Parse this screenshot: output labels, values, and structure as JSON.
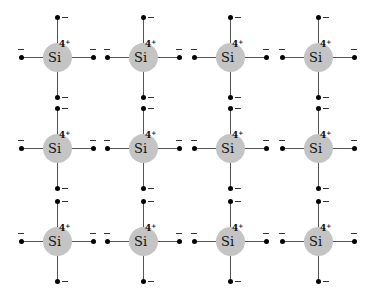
{
  "diagram": {
    "type": "silicon crystal lattice (2D representation)",
    "element_symbol": "Si",
    "core_charge": "4",
    "core_charge_sign": "+",
    "electron_sign": "−",
    "rows": 3,
    "cols": 4,
    "col_x": [
      57,
      143,
      230,
      318
    ],
    "row_y": [
      57,
      148,
      241
    ],
    "colors": {
      "nucleus": "#c4c4c4",
      "electron": "#000000",
      "bond": "#555555",
      "background": "#ffffff"
    },
    "atoms": [
      {
        "row": 0,
        "col": 0,
        "label": "Si",
        "charge": "4+"
      },
      {
        "row": 0,
        "col": 1,
        "label": "Si",
        "charge": "4+"
      },
      {
        "row": 0,
        "col": 2,
        "label": "Si",
        "charge": "4+"
      },
      {
        "row": 0,
        "col": 3,
        "label": "Si",
        "charge": "4+"
      },
      {
        "row": 1,
        "col": 0,
        "label": "Si",
        "charge": "4+"
      },
      {
        "row": 1,
        "col": 1,
        "label": "Si",
        "charge": "4+"
      },
      {
        "row": 1,
        "col": 2,
        "label": "Si",
        "charge": "4+"
      },
      {
        "row": 1,
        "col": 3,
        "label": "Si",
        "charge": "4+"
      },
      {
        "row": 2,
        "col": 0,
        "label": "Si",
        "charge": "4+"
      },
      {
        "row": 2,
        "col": 1,
        "label": "Si",
        "charge": "4+"
      },
      {
        "row": 2,
        "col": 2,
        "label": "Si",
        "charge": "4+"
      },
      {
        "row": 2,
        "col": 3,
        "label": "Si",
        "charge": "4+"
      }
    ]
  }
}
